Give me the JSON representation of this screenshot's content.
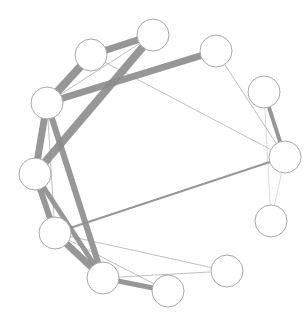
{
  "diagram": {
    "type": "network-graph",
    "layout": "circular",
    "node_radius": 16,
    "colors": {
      "edge": "#8c8c8c",
      "node_fill": "#ffffff",
      "node_stroke": "#a8a8a8",
      "background": "#ffffff"
    },
    "nodes": [
      {
        "id": "n1",
        "x": 153,
        "y": 35
      },
      {
        "id": "n2",
        "x": 91,
        "y": 55
      },
      {
        "id": "n3",
        "x": 216,
        "y": 51
      },
      {
        "id": "n4",
        "x": 47,
        "y": 103
      },
      {
        "id": "n5",
        "x": 264,
        "y": 92
      },
      {
        "id": "n6",
        "x": 285,
        "y": 157
      },
      {
        "id": "n7",
        "x": 35,
        "y": 174
      },
      {
        "id": "n8",
        "x": 271,
        "y": 221
      },
      {
        "id": "n9",
        "x": 55,
        "y": 233
      },
      {
        "id": "n10",
        "x": 227,
        "y": 271
      },
      {
        "id": "n11",
        "x": 103,
        "y": 278
      },
      {
        "id": "n12",
        "x": 168,
        "y": 291
      }
    ],
    "edges": [
      {
        "source": "n1",
        "target": "n2",
        "weight": 7
      },
      {
        "source": "n1",
        "target": "n7",
        "weight": 8
      },
      {
        "source": "n1",
        "target": "n4",
        "weight": 1
      },
      {
        "source": "n2",
        "target": "n4",
        "weight": 8
      },
      {
        "source": "n2",
        "target": "n6",
        "weight": 1
      },
      {
        "source": "n3",
        "target": "n4",
        "weight": 7
      },
      {
        "source": "n3",
        "target": "n6",
        "weight": 1
      },
      {
        "source": "n4",
        "target": "n7",
        "weight": 7
      },
      {
        "source": "n4",
        "target": "n11",
        "weight": 6
      },
      {
        "source": "n4",
        "target": "n9",
        "weight": 1
      },
      {
        "source": "n5",
        "target": "n6",
        "weight": 4
      },
      {
        "source": "n5",
        "target": "n8",
        "weight": 0.6
      },
      {
        "source": "n6",
        "target": "n9",
        "weight": 2
      },
      {
        "source": "n6",
        "target": "n8",
        "weight": 0.6
      },
      {
        "source": "n7",
        "target": "n9",
        "weight": 6
      },
      {
        "source": "n7",
        "target": "n11",
        "weight": 5
      },
      {
        "source": "n9",
        "target": "n11",
        "weight": 7
      },
      {
        "source": "n9",
        "target": "n10",
        "weight": 1
      },
      {
        "source": "n11",
        "target": "n12",
        "weight": 5
      },
      {
        "source": "n11",
        "target": "n10",
        "weight": 1
      },
      {
        "source": "n9",
        "target": "n12",
        "weight": 1
      }
    ]
  }
}
